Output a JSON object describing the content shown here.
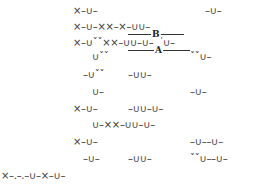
{
  "scansion": {
    "lines": [
      {
        "segments": [
          {
            "text": "×–∪–",
            "x": 73,
            "y": 6
          },
          {
            "text": "–∪–",
            "x": 205,
            "y": 6
          }
        ]
      },
      {
        "segments": [
          {
            "text": "×–∪–××–×–∪∪–",
            "x": 73,
            "y": 22
          }
        ]
      },
      {
        "segments": [
          {
            "text": "×–∪ˇˇ××–∪∪–∪–ˇˇ∪–",
            "x": 73,
            "y": 38
          }
        ]
      },
      {
        "segments": [
          {
            "text": "∪ˇˇ",
            "x": 92,
            "y": 52
          },
          {
            "text": "ˇˇ∪–",
            "x": 190,
            "y": 52
          }
        ]
      },
      {
        "segments": [
          {
            "text": "–∪ˇˇ",
            "x": 83,
            "y": 70
          },
          {
            "text": "–∪∪–",
            "x": 128,
            "y": 70
          }
        ]
      },
      {
        "segments": [
          {
            "text": "∪–",
            "x": 92,
            "y": 87
          },
          {
            "text": "–∪–",
            "x": 190,
            "y": 87
          }
        ]
      },
      {
        "segments": [
          {
            "text": "×–∪–",
            "x": 73,
            "y": 104
          },
          {
            "text": "–∪∪–∪–",
            "x": 128,
            "y": 104
          }
        ]
      },
      {
        "segments": [
          {
            "text": "∪–××–∪∪–∪–",
            "x": 92,
            "y": 120
          }
        ]
      },
      {
        "segments": [
          {
            "text": "×–∪–",
            "x": 73,
            "y": 137
          },
          {
            "text": "–∪––∪–",
            "x": 190,
            "y": 137
          }
        ]
      },
      {
        "segments": [
          {
            "text": "–∪–",
            "x": 83,
            "y": 154
          },
          {
            "text": "–∪∪–",
            "x": 128,
            "y": 154
          },
          {
            "text": "ˇˇ∪––∪–",
            "x": 190,
            "y": 154
          }
        ]
      },
      {
        "segments": [
          {
            "text": "×–.–.–∪–×–∪–",
            "x": 1,
            "y": 171
          }
        ]
      }
    ],
    "brackets": [
      {
        "label": "B",
        "x": 128,
        "y": 34,
        "width": 56,
        "label_x": 151,
        "label_y": 30
      },
      {
        "label": "A",
        "x": 128,
        "y": 50,
        "width": 62,
        "label_x": 154,
        "label_y": 46
      }
    ]
  }
}
